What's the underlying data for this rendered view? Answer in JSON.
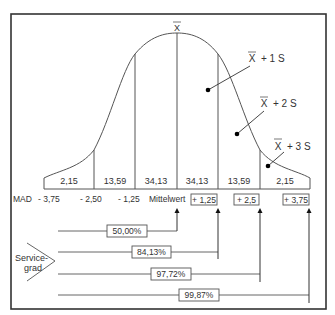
{
  "diagram": {
    "mean_symbol": "X̄",
    "mean_top_label": "X",
    "annotations": [
      {
        "label": "+ 1 S",
        "sigma": 1
      },
      {
        "label": "+ 2 S",
        "sigma": 2
      },
      {
        "label": "+ 3 S",
        "sigma": 3
      }
    ],
    "segment_percentages": [
      "2,15",
      "13,59",
      "34,13",
      "34,13",
      "13,59",
      "2,15"
    ],
    "mad_axis": {
      "prefix": "MAD",
      "left_values": [
        "- 3,75",
        "- 2,50",
        "- 1,25"
      ],
      "center_label": "Mittelwert",
      "right_values": [
        "+ 1,25",
        "+ 2,5",
        "+ 3,75"
      ]
    },
    "service_level": {
      "label_line1": "Service-",
      "label_line2": "grad",
      "levels": [
        "50,00%",
        "84,13%",
        "97,72%",
        "99,87%"
      ]
    }
  }
}
